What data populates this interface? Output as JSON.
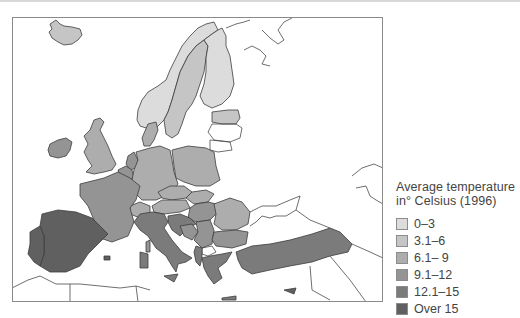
{
  "legend": {
    "title_line1": "Average temperature",
    "title_line2": "in° Celsius (1996)",
    "items": [
      {
        "label": "0–3",
        "color": "#dcdcdc"
      },
      {
        "label": "3.1–6",
        "color": "#c5c5c5"
      },
      {
        "label": "6.1– 9",
        "color": "#adadad"
      },
      {
        "label": "9.1–12",
        "color": "#949494"
      },
      {
        "label": "12.1–15",
        "color": "#7b7b7b"
      },
      {
        "label": "Over 15",
        "color": "#606060"
      }
    ]
  },
  "map": {
    "region": "Europe",
    "countries": [
      {
        "name": "Iceland",
        "category": "3.1–6"
      },
      {
        "name": "Norway",
        "category": "0–3"
      },
      {
        "name": "Sweden",
        "category": "3.1–6"
      },
      {
        "name": "Finland",
        "category": "0–3"
      },
      {
        "name": "Estonia",
        "category": "3.1–6"
      },
      {
        "name": "Ireland",
        "category": "9.1–12"
      },
      {
        "name": "United Kingdom",
        "category": "6.1– 9"
      },
      {
        "name": "Denmark",
        "category": "6.1– 9"
      },
      {
        "name": "Netherlands",
        "category": "9.1–12"
      },
      {
        "name": "Belgium",
        "category": "9.1–12"
      },
      {
        "name": "Luxembourg",
        "category": "9.1–12"
      },
      {
        "name": "Germany",
        "category": "6.1– 9"
      },
      {
        "name": "Poland",
        "category": "6.1– 9"
      },
      {
        "name": "Czech Republic",
        "category": "6.1– 9"
      },
      {
        "name": "Slovakia",
        "category": "6.1– 9"
      },
      {
        "name": "Austria",
        "category": "6.1– 9"
      },
      {
        "name": "Switzerland",
        "category": "6.1– 9"
      },
      {
        "name": "Hungary",
        "category": "9.1–12"
      },
      {
        "name": "Romania",
        "category": "6.1– 9"
      },
      {
        "name": "Bulgaria",
        "category": "9.1–12"
      },
      {
        "name": "Slovenia",
        "category": "9.1–12"
      },
      {
        "name": "Croatia",
        "category": "12.1–15"
      },
      {
        "name": "Bosnia",
        "category": "9.1–12"
      },
      {
        "name": "Serbia",
        "category": "9.1–12"
      },
      {
        "name": "Albania",
        "category": "12.1–15"
      },
      {
        "name": "Greece",
        "category": "12.1–15"
      },
      {
        "name": "France",
        "category": "9.1–12"
      },
      {
        "name": "Italy",
        "category": "12.1–15"
      },
      {
        "name": "Spain",
        "category": "Over 15"
      },
      {
        "name": "Portugal",
        "category": "Over 15"
      },
      {
        "name": "Turkey",
        "category": "12.1–15"
      },
      {
        "name": "Cyprus",
        "category": "Over 15"
      }
    ]
  }
}
